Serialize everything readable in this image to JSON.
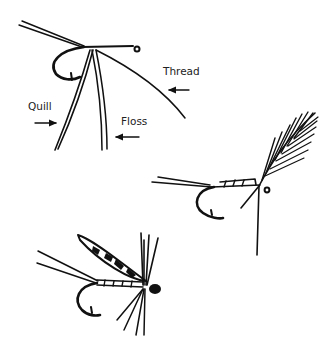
{
  "figure": {
    "ink_color": "#111111",
    "background": "#ffffff"
  },
  "labels": {
    "thread": "Thread",
    "quill": "Quill",
    "floss": "Floss"
  },
  "stages": [
    {
      "name": "materials-tied-in",
      "annotations": [
        "Thread",
        "Quill",
        "Floss"
      ]
    },
    {
      "name": "body-with-hackle-feather"
    },
    {
      "name": "finished-winged-wet-fly"
    }
  ]
}
